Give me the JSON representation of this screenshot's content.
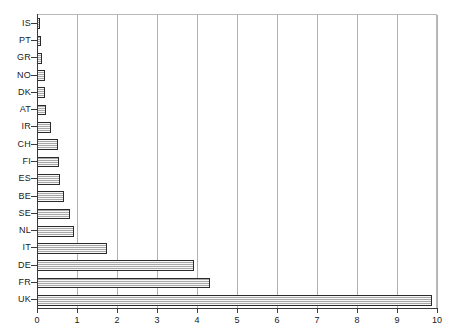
{
  "chart_data": {
    "type": "bar",
    "orientation": "horizontal",
    "title": "",
    "subtitle": "",
    "xlabel": "",
    "ylabel": "",
    "xlim": [
      0,
      10
    ],
    "ylim": null,
    "grid": "vertical",
    "legend": null,
    "xticks": [
      "0",
      "1",
      "2",
      "3",
      "4",
      "5",
      "6",
      "7",
      "8",
      "9",
      "10"
    ],
    "xtick_values": [
      0,
      1,
      2,
      3,
      4,
      5,
      6,
      7,
      8,
      9,
      10
    ],
    "categories": [
      "IS",
      "PT",
      "GR",
      "NO",
      "DK",
      "AT",
      "IR",
      "CH",
      "FI",
      "ES",
      "BE",
      "SE",
      "NL",
      "IT",
      "DE",
      "FR",
      "UK"
    ],
    "values": [
      0.08,
      0.1,
      0.13,
      0.19,
      0.21,
      0.23,
      0.36,
      0.52,
      0.56,
      0.57,
      0.67,
      0.82,
      0.92,
      1.75,
      3.92,
      4.32,
      9.88
    ],
    "series": [
      {
        "name": "",
        "values": [
          0.08,
          0.1,
          0.13,
          0.19,
          0.21,
          0.23,
          0.36,
          0.52,
          0.56,
          0.57,
          0.67,
          0.82,
          0.92,
          1.75,
          3.92,
          4.32,
          9.88
        ]
      }
    ],
    "bar_fill_color": "#c9c9c9",
    "bar_edge_color": "#2b2b2b",
    "gridline_color": "#b2b2b2",
    "axis_color": "#3a3a3a",
    "background_color": "#ffffff"
  }
}
